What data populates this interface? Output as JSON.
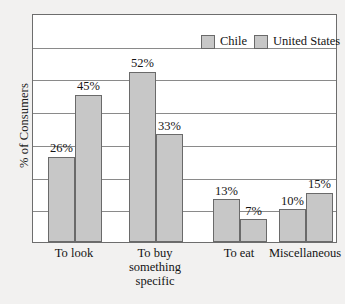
{
  "chart_data": {
    "type": "bar",
    "title": "",
    "xlabel": "",
    "ylabel": "% of Consumers",
    "ylim": [
      0,
      70
    ],
    "grid": true,
    "grid_step": 10,
    "legend_position": "top-right",
    "categories": [
      "To look",
      "To buy something specific",
      "To eat",
      "Miscellaneous"
    ],
    "category_lines": [
      [
        "To look"
      ],
      [
        "To buy",
        "something",
        "specific"
      ],
      [
        "To eat"
      ],
      [
        "Miscellaneous"
      ]
    ],
    "series": [
      {
        "name": "Chile",
        "color": "#c7c7c7",
        "values": [
          26,
          52,
          13,
          10
        ],
        "labels": [
          "26%",
          "52%",
          "13%",
          "10%"
        ]
      },
      {
        "name": "United States",
        "color": "#c7c7c7",
        "values": [
          45,
          33,
          7,
          15
        ],
        "labels": [
          "45%",
          "33%",
          "7%",
          "15%"
        ]
      }
    ]
  },
  "legend": {
    "entries": [
      {
        "label": "Chile",
        "swatch": "#c7c7c7"
      },
      {
        "label": "United States",
        "swatch": "#c7c7c7"
      }
    ]
  },
  "axis": {
    "y_title": "% of Consumers"
  },
  "colors": {
    "bar_fill": "#c7c7c7",
    "bar_edge": "#6a6a6a",
    "plot_background": "#ffffff",
    "page_background": "#f2f1f0",
    "gridline": "#8a8a8a",
    "frame": "#6d6d6d",
    "text": "#141414"
  }
}
